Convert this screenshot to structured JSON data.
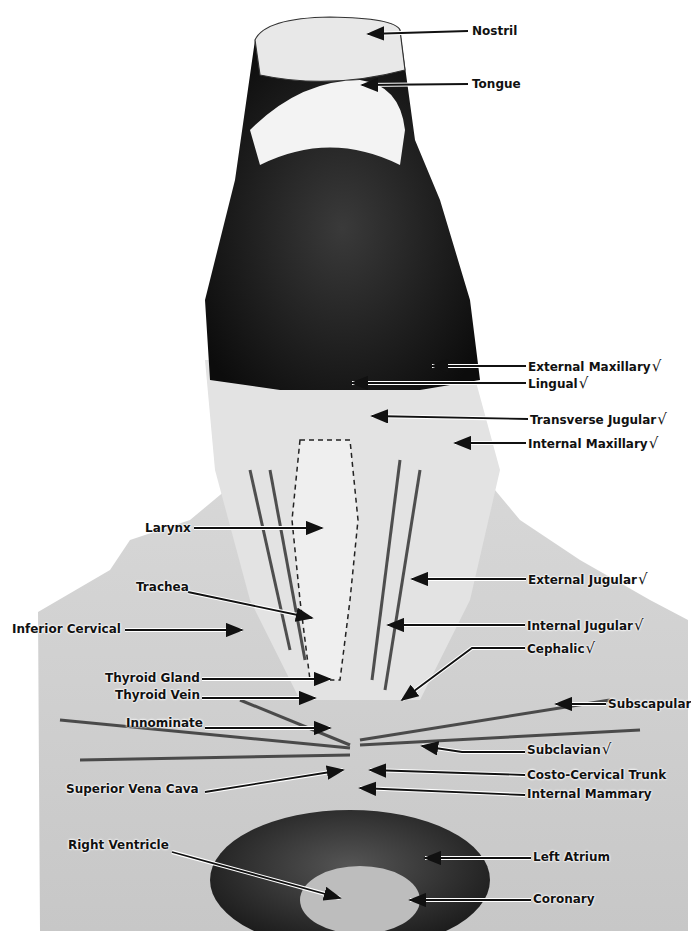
{
  "figure": {
    "colors": {
      "background": "#ffffff",
      "label_text": "#111111",
      "dark_tissue": "#1a1a1a",
      "light_tissue": "#e6e6e6"
    },
    "check_glyph": "√"
  },
  "labels": [
    {
      "id": "nostril",
      "text": "Nostril",
      "x": 472,
      "y": 24,
      "checked": false,
      "arrow": [
        [
          468,
          31
        ],
        [
          368,
          34
        ]
      ]
    },
    {
      "id": "tongue",
      "text": "Tongue",
      "x": 472,
      "y": 77,
      "checked": false,
      "arrow": [
        [
          468,
          84
        ],
        [
          362,
          85
        ]
      ]
    },
    {
      "id": "external-maxillary",
      "text": "External Maxillary",
      "x": 528,
      "y": 359,
      "checked": true,
      "arrow": [
        [
          526,
          366
        ],
        [
          432,
          366
        ]
      ]
    },
    {
      "id": "lingual",
      "text": "Lingual",
      "x": 528,
      "y": 376,
      "checked": true,
      "arrow": [
        [
          526,
          383
        ],
        [
          352,
          383
        ]
      ]
    },
    {
      "id": "transverse-jugular",
      "text": "Transverse Jugular",
      "x": 530,
      "y": 412,
      "checked": true,
      "arrow": [
        [
          528,
          419
        ],
        [
          372,
          416
        ]
      ]
    },
    {
      "id": "internal-maxillary",
      "text": "Internal Maxillary",
      "x": 528,
      "y": 436,
      "checked": true,
      "arrow": [
        [
          526,
          443
        ],
        [
          455,
          443
        ]
      ]
    },
    {
      "id": "larynx",
      "text": "Larynx",
      "x": 145,
      "y": 521,
      "checked": false,
      "arrow": [
        [
          194,
          528
        ],
        [
          322,
          528
        ]
      ]
    },
    {
      "id": "external-jugular",
      "text": "External Jugular",
      "x": 528,
      "y": 572,
      "checked": true,
      "arrow": [
        [
          526,
          579
        ],
        [
          412,
          579
        ]
      ]
    },
    {
      "id": "trachea",
      "text": "Trachea",
      "x": 136,
      "y": 580,
      "checked": false,
      "arrow": [
        [
          188,
          592
        ],
        [
          312,
          618
        ]
      ]
    },
    {
      "id": "inferior-cervical",
      "text": "Inferior Cervical",
      "x": 12,
      "y": 622,
      "checked": false,
      "arrow": [
        [
          125,
          630
        ],
        [
          242,
          630
        ]
      ]
    },
    {
      "id": "internal-jugular",
      "text": "Internal Jugular",
      "x": 527,
      "y": 618,
      "checked": true,
      "arrow": [
        [
          525,
          625
        ],
        [
          388,
          625
        ]
      ]
    },
    {
      "id": "cephalic",
      "text": "Cephalic",
      "x": 527,
      "y": 641,
      "checked": true,
      "arrow": [
        [
          525,
          648
        ],
        [
          472,
          648
        ],
        [
          402,
          700
        ]
      ]
    },
    {
      "id": "thyroid-gland",
      "text": "Thyroid Gland",
      "x": 105,
      "y": 671,
      "checked": false,
      "arrow": [
        [
          202,
          679
        ],
        [
          330,
          679
        ]
      ]
    },
    {
      "id": "thyroid-vein",
      "text": "Thyroid Vein",
      "x": 115,
      "y": 688,
      "checked": false,
      "arrow": [
        [
          202,
          698
        ],
        [
          315,
          698
        ]
      ]
    },
    {
      "id": "subscapular",
      "text": "Subscapular",
      "x": 608,
      "y": 697,
      "checked": false,
      "arrow": [
        [
          606,
          704
        ],
        [
          556,
          704
        ]
      ]
    },
    {
      "id": "innominate",
      "text": "Innominate",
      "x": 126,
      "y": 716,
      "checked": false,
      "arrow": [
        [
          205,
          728
        ],
        [
          330,
          728
        ]
      ]
    },
    {
      "id": "subclavian",
      "text": "Subclavian",
      "x": 527,
      "y": 742,
      "checked": true,
      "arrow": [
        [
          525,
          752
        ],
        [
          462,
          752
        ],
        [
          422,
          746
        ]
      ]
    },
    {
      "id": "costo-cervical-trunk",
      "text": "Costo-Cervical Trunk",
      "x": 527,
      "y": 768,
      "checked": false,
      "arrow": [
        [
          525,
          775
        ],
        [
          370,
          770
        ]
      ]
    },
    {
      "id": "superior-vena-cava",
      "text": "Superior Vena Cava",
      "x": 66,
      "y": 782,
      "checked": false,
      "arrow": [
        [
          205,
          792
        ],
        [
          343,
          770
        ]
      ]
    },
    {
      "id": "internal-mammary",
      "text": "Internal Mammary",
      "x": 527,
      "y": 787,
      "checked": false,
      "arrow": [
        [
          525,
          795
        ],
        [
          360,
          788
        ]
      ]
    },
    {
      "id": "right-ventricle",
      "text": "Right Ventricle",
      "x": 68,
      "y": 838,
      "checked": false,
      "arrow": [
        [
          172,
          852
        ],
        [
          340,
          898
        ]
      ]
    },
    {
      "id": "left-atrium",
      "text": "Left Atrium",
      "x": 533,
      "y": 850,
      "checked": false,
      "arrow": [
        [
          531,
          858
        ],
        [
          425,
          858
        ]
      ]
    },
    {
      "id": "coronary",
      "text": "Coronary",
      "x": 533,
      "y": 892,
      "checked": false,
      "arrow": [
        [
          531,
          900
        ],
        [
          410,
          900
        ]
      ]
    }
  ]
}
